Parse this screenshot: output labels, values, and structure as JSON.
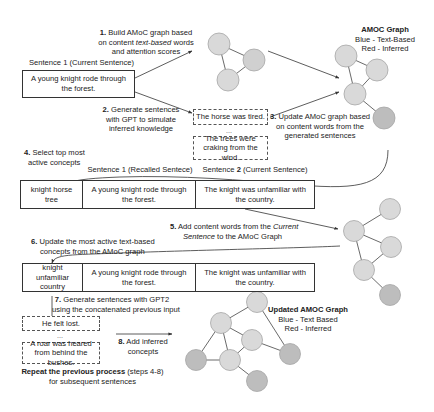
{
  "step1": {
    "num": "1.",
    "line1": "Build AMoC graph based",
    "line2a": "on content ",
    "line2b": "text-based",
    "line2c": " words",
    "line3": "and attention scores"
  },
  "sentence1": {
    "label_a": "Sentence ",
    "label_num": "1",
    "label_b": " (Current Sentence)",
    "text": "A young knight rode through the forest."
  },
  "step2": {
    "num": "2.",
    "line1": "Generate sentences",
    "line2": "with GPT to simulate",
    "line3": "inferred knowledge"
  },
  "generated1": {
    "s1": "The horse was tired.",
    "ellipsis": "...",
    "s2": "The trees were craking from the wind."
  },
  "step3": {
    "num": "3.",
    "line1": "Update AMoC graph based",
    "line2": "on content words from the",
    "line3": "generated sentences"
  },
  "graph1": {
    "title": "AMOC Graph",
    "legend_blue": "Blue - Text-Based",
    "legend_red": "Red - Inferred"
  },
  "step4": {
    "num": "4.",
    "line1": "Select top most",
    "line2": "active concepts"
  },
  "table1": {
    "header_recalled_a": "Sentence ",
    "header_recalled_num": "1",
    "header_recalled_b": " (Recalled Sentece)",
    "header_current_a": "Sentence ",
    "header_current_num": "2",
    "header_current_b": " (Current Sentence)",
    "cells": [
      "knight horse tree",
      "A young knight rode through the forest.",
      "The knight was unfamiliar with the country."
    ]
  },
  "step5": {
    "num": "5.",
    "line1a": "Add content words from the ",
    "line1b": "Current",
    "line2a": "Sentence",
    "line2b": " to the AMoC Graph"
  },
  "step6": {
    "num": "6.",
    "line1": "Update the most active text-based",
    "line2": "concepts from the AMoC graph"
  },
  "table2": {
    "cells": [
      "knight unfamiliar country",
      "A young knight rode through the forest.",
      "The knight was unfamiliar with the country."
    ]
  },
  "step7": {
    "num": "7.",
    "line1": "Generate sentences with GPT2",
    "line2": "using the concatenated previous input"
  },
  "generated2": {
    "s1": "He felt lost.",
    "ellipsis": "...",
    "s2": "A roar was heared from behind the bushes."
  },
  "step8": {
    "num": "8.",
    "line1": "Add inferred",
    "line2": "concepts"
  },
  "repeat": {
    "bold": "Repeat the previous process",
    "steps": " (steps 4-8)",
    "line2": "for subsequent sentences"
  },
  "graph_final": {
    "title": "Updated AMOC Graph",
    "legend_blue": "Blue - Text Based",
    "legend_red": "Red - Inferred"
  },
  "colors": {
    "node_text": "#d9d9d9",
    "node_inferred": "#bdbdbd",
    "node_stroke": "#a6a6a6",
    "edge": "#444444",
    "arrow": "#333333"
  }
}
